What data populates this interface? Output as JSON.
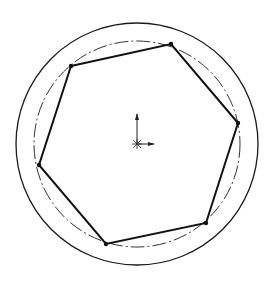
{
  "drawing": {
    "background": "#ffffff",
    "stroke_color": "#1a1a1a",
    "outer_circle": {
      "cx": 137,
      "cy": 144,
      "r": 121
    },
    "construction_circle": {
      "cx": 137,
      "cy": 144,
      "r": 103,
      "style": "dash-dot"
    },
    "hexagon_vertices": [
      [
        71,
        66
      ],
      [
        171,
        44
      ],
      [
        238,
        123
      ],
      [
        206,
        223
      ],
      [
        106,
        244
      ],
      [
        39,
        165
      ]
    ],
    "origin": {
      "x": 137,
      "y": 144,
      "y_axis_end": [
        137,
        114
      ],
      "x_axis_end": [
        154,
        144
      ]
    }
  }
}
